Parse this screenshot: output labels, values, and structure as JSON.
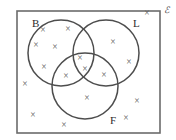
{
  "diagram": {
    "type": "venn",
    "universe": {
      "label": "ℰ",
      "label_name": "universal-set-symbol",
      "rect": {
        "x": 17,
        "y": 11,
        "width": 143,
        "height": 122
      },
      "stroke": "#6b6b6b"
    },
    "sets": [
      {
        "id": "B",
        "label": "B",
        "cx": 61,
        "cy": 53,
        "r": 33,
        "label_x": 32,
        "label_y": 27
      },
      {
        "id": "L",
        "label": "L",
        "cx": 106,
        "cy": 53,
        "r": 33,
        "label_x": 133,
        "label_y": 27
      },
      {
        "id": "F",
        "label": "F",
        "cx": 85,
        "cy": 86,
        "r": 33,
        "label_x": 110,
        "label_y": 124
      }
    ],
    "mark_glyph": "×",
    "marks": [
      {
        "region": "B",
        "x": 43,
        "y": 31
      },
      {
        "region": "B",
        "x": 68,
        "y": 30
      },
      {
        "region": "B",
        "x": 36,
        "y": 46
      },
      {
        "region": "B",
        "x": 55,
        "y": 48
      },
      {
        "region": "B",
        "x": 44,
        "y": 68
      },
      {
        "region": "L",
        "x": 113,
        "y": 43
      },
      {
        "region": "L",
        "x": 129,
        "y": 63
      },
      {
        "region": "B-and-L",
        "x": 80,
        "y": 59
      },
      {
        "region": "B-and-L-and-F",
        "x": 85,
        "y": 70
      },
      {
        "region": "B-and-F",
        "x": 66,
        "y": 77
      },
      {
        "region": "L-and-F",
        "x": 104,
        "y": 76
      },
      {
        "region": "F",
        "x": 87,
        "y": 99
      },
      {
        "region": "outside",
        "x": 147,
        "y": 14
      },
      {
        "region": "outside",
        "x": 25,
        "y": 85
      },
      {
        "region": "outside",
        "x": 33,
        "y": 116
      },
      {
        "region": "outside",
        "x": 64,
        "y": 126
      },
      {
        "region": "outside",
        "x": 137,
        "y": 102
      },
      {
        "region": "outside",
        "x": 126,
        "y": 119
      }
    ],
    "counts": {
      "B_only": 5,
      "L_only": 2,
      "F_only": 1,
      "B_and_L_only": 1,
      "B_and_F_only": 1,
      "L_and_F_only": 1,
      "all_three": 1,
      "outside": 6,
      "total": 18
    }
  }
}
